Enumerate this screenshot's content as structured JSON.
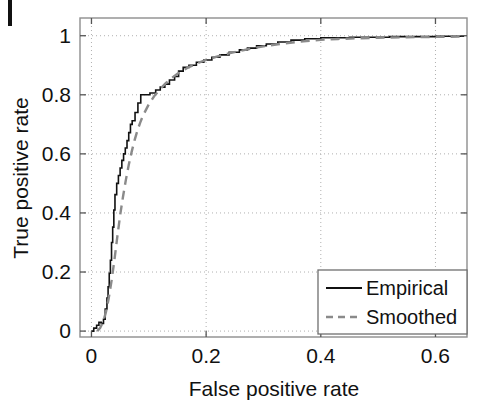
{
  "figure": {
    "name": "roc-curve-figure",
    "background": "#ffffff",
    "artifact_label": ""
  },
  "chart_data": {
    "type": "line",
    "title": "",
    "subtitle": "",
    "xlabel": "False positive rate",
    "ylabel": "True positive rate",
    "xlim": [
      -0.02,
      0.655
    ],
    "ylim": [
      -0.02,
      1.06
    ],
    "xticks": [
      0,
      0.2,
      0.4,
      0.6
    ],
    "xticklabels": [
      "0",
      "0.2",
      "0.4",
      "0.6"
    ],
    "yticks": [
      0,
      0.2,
      0.4,
      0.6,
      0.8,
      1
    ],
    "yticklabels": [
      "0",
      "0.2",
      "0.4",
      "0.6",
      "0.8",
      "1"
    ],
    "grid": true,
    "grid_style": "dotted",
    "grid_color": "#b0b0b0",
    "legend_position": "lower right",
    "axes_color": "#808080",
    "series": [
      {
        "name": "Empirical",
        "label": "Empirical",
        "style": "solid",
        "color": "#111111",
        "width": 1.6,
        "points": [
          [
            0.0,
            0.0
          ],
          [
            0.004,
            0.0
          ],
          [
            0.004,
            0.01
          ],
          [
            0.009,
            0.01
          ],
          [
            0.009,
            0.02
          ],
          [
            0.013,
            0.02
          ],
          [
            0.013,
            0.03
          ],
          [
            0.017,
            0.03
          ],
          [
            0.017,
            0.026
          ],
          [
            0.021,
            0.026
          ],
          [
            0.021,
            0.04
          ],
          [
            0.024,
            0.04
          ],
          [
            0.024,
            0.075
          ],
          [
            0.027,
            0.075
          ],
          [
            0.027,
            0.112
          ],
          [
            0.029,
            0.112
          ],
          [
            0.029,
            0.15
          ],
          [
            0.031,
            0.15
          ],
          [
            0.031,
            0.196
          ],
          [
            0.033,
            0.196
          ],
          [
            0.033,
            0.24
          ],
          [
            0.035,
            0.24
          ],
          [
            0.035,
            0.3
          ],
          [
            0.037,
            0.3
          ],
          [
            0.037,
            0.352
          ],
          [
            0.039,
            0.352
          ],
          [
            0.039,
            0.41
          ],
          [
            0.041,
            0.41
          ],
          [
            0.041,
            0.462
          ],
          [
            0.044,
            0.462
          ],
          [
            0.044,
            0.5
          ],
          [
            0.047,
            0.5
          ],
          [
            0.047,
            0.527
          ],
          [
            0.05,
            0.527
          ],
          [
            0.05,
            0.552
          ],
          [
            0.053,
            0.552
          ],
          [
            0.053,
            0.578
          ],
          [
            0.056,
            0.578
          ],
          [
            0.056,
            0.6
          ],
          [
            0.059,
            0.6
          ],
          [
            0.059,
            0.62
          ],
          [
            0.062,
            0.62
          ],
          [
            0.062,
            0.645
          ],
          [
            0.065,
            0.645
          ],
          [
            0.065,
            0.672
          ],
          [
            0.068,
            0.672
          ],
          [
            0.068,
            0.7
          ],
          [
            0.071,
            0.7
          ],
          [
            0.071,
            0.712
          ],
          [
            0.076,
            0.712
          ],
          [
            0.076,
            0.74
          ],
          [
            0.081,
            0.74
          ],
          [
            0.081,
            0.772
          ],
          [
            0.086,
            0.772
          ],
          [
            0.086,
            0.8
          ],
          [
            0.102,
            0.8
          ],
          [
            0.102,
            0.806
          ],
          [
            0.112,
            0.806
          ],
          [
            0.112,
            0.816
          ],
          [
            0.12,
            0.816
          ],
          [
            0.12,
            0.826
          ],
          [
            0.128,
            0.826
          ],
          [
            0.128,
            0.836
          ],
          [
            0.136,
            0.836
          ],
          [
            0.136,
            0.85
          ],
          [
            0.145,
            0.85
          ],
          [
            0.145,
            0.862
          ],
          [
            0.152,
            0.862
          ],
          [
            0.152,
            0.88
          ],
          [
            0.16,
            0.88
          ],
          [
            0.16,
            0.893
          ],
          [
            0.17,
            0.893
          ],
          [
            0.17,
            0.9
          ],
          [
            0.183,
            0.9
          ],
          [
            0.183,
            0.91
          ],
          [
            0.196,
            0.91
          ],
          [
            0.196,
            0.918
          ],
          [
            0.21,
            0.918
          ],
          [
            0.21,
            0.927
          ],
          [
            0.224,
            0.927
          ],
          [
            0.224,
            0.935
          ],
          [
            0.24,
            0.935
          ],
          [
            0.24,
            0.944
          ],
          [
            0.258,
            0.944
          ],
          [
            0.258,
            0.952
          ],
          [
            0.272,
            0.952
          ],
          [
            0.272,
            0.958
          ],
          [
            0.288,
            0.958
          ],
          [
            0.288,
            0.966
          ],
          [
            0.305,
            0.966
          ],
          [
            0.305,
            0.972
          ],
          [
            0.325,
            0.972
          ],
          [
            0.325,
            0.979
          ],
          [
            0.348,
            0.979
          ],
          [
            0.348,
            0.985
          ],
          [
            0.372,
            0.985
          ],
          [
            0.372,
            0.99
          ],
          [
            0.4,
            0.99
          ],
          [
            0.4,
            0.993
          ],
          [
            0.45,
            0.993
          ],
          [
            0.45,
            0.995
          ],
          [
            0.52,
            0.995
          ],
          [
            0.52,
            0.997
          ],
          [
            0.6,
            0.997
          ],
          [
            0.6,
            0.998
          ],
          [
            0.65,
            0.998
          ]
        ]
      },
      {
        "name": "Smoothed",
        "label": "Smoothed",
        "style": "dashed",
        "color": "#8a8a8a",
        "width": 2.4,
        "dasharray": "9,6",
        "points": [
          [
            0.01,
            0.0
          ],
          [
            0.015,
            0.01
          ],
          [
            0.02,
            0.03
          ],
          [
            0.025,
            0.062
          ],
          [
            0.03,
            0.11
          ],
          [
            0.035,
            0.17
          ],
          [
            0.04,
            0.24
          ],
          [
            0.045,
            0.318
          ],
          [
            0.05,
            0.392
          ],
          [
            0.055,
            0.455
          ],
          [
            0.06,
            0.512
          ],
          [
            0.065,
            0.562
          ],
          [
            0.07,
            0.606
          ],
          [
            0.075,
            0.645
          ],
          [
            0.08,
            0.678
          ],
          [
            0.085,
            0.706
          ],
          [
            0.09,
            0.73
          ],
          [
            0.1,
            0.768
          ],
          [
            0.11,
            0.797
          ],
          [
            0.12,
            0.82
          ],
          [
            0.13,
            0.84
          ],
          [
            0.14,
            0.857
          ],
          [
            0.15,
            0.871
          ],
          [
            0.16,
            0.883
          ],
          [
            0.17,
            0.894
          ],
          [
            0.185,
            0.907
          ],
          [
            0.2,
            0.918
          ],
          [
            0.22,
            0.93
          ],
          [
            0.24,
            0.94
          ],
          [
            0.26,
            0.949
          ],
          [
            0.28,
            0.957
          ],
          [
            0.3,
            0.964
          ],
          [
            0.325,
            0.971
          ],
          [
            0.35,
            0.977
          ],
          [
            0.375,
            0.982
          ],
          [
            0.4,
            0.986
          ],
          [
            0.43,
            0.989
          ],
          [
            0.46,
            0.991
          ],
          [
            0.5,
            0.993
          ],
          [
            0.55,
            0.995
          ],
          [
            0.6,
            0.996
          ],
          [
            0.65,
            0.997
          ]
        ]
      }
    ]
  }
}
